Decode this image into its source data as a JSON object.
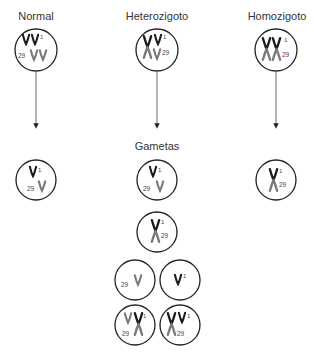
{
  "headers": {
    "normal": "Normal",
    "heterozygote": "Heterozigoto",
    "homozygote": "Homozigoto"
  },
  "gametes_label": "Gametas",
  "chromosome_labels": {
    "chr1": "1",
    "chr29": "29"
  },
  "colors": {
    "chr1": "#1a1a1a",
    "chr29": "#7a7a7a",
    "circle": "#222222",
    "arrow": "#555555"
  },
  "cells": {
    "normal_parent": {
      "type": "parent",
      "content": "two chr1 + two chr29"
    },
    "heterozygote_parent": {
      "type": "parent",
      "content": "fusion 1/29 + chr1 + chr29"
    },
    "homozygote_parent": {
      "type": "parent",
      "content": "two fusions 1/29"
    },
    "normal_gamete": {
      "content": "chr1 + chr29"
    },
    "het_gametes": [
      {
        "content": "chr1 + chr29"
      },
      {
        "content": "fusion 1/29"
      },
      {
        "content": "chr29"
      },
      {
        "content": "chr1"
      },
      {
        "content": "chr29 + fusion 1/29"
      },
      {
        "content": "fusion 1/29 + chr1"
      }
    ],
    "homozygote_gamete": {
      "content": "fusion 1/29"
    }
  }
}
